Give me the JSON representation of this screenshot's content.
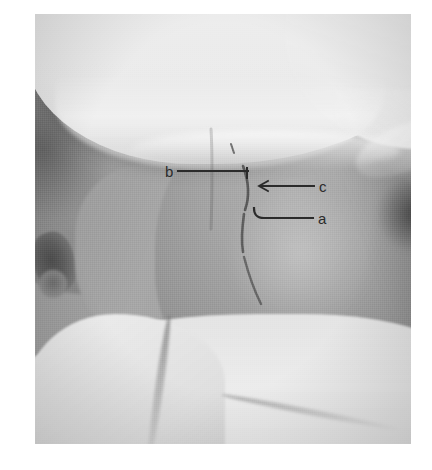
{
  "figure": {
    "kind": "clinical-photograph",
    "modality": "grayscale photograph",
    "surgical_markings": "ink line drawn on skin over the posterior midline / paraspinal region",
    "drapes": "white cloth drape above the shoulder and white bed sheet below",
    "background_color": "#9a9a9a",
    "ink_color": "#2b2b2b",
    "plate": {
      "left": 35,
      "top": 14,
      "width": 376,
      "height": 430
    }
  },
  "annotations": {
    "items": [
      {
        "id": "b",
        "label": "b",
        "label_x": 165,
        "label_y": 164,
        "leader": {
          "x1": 178,
          "y1": 171,
          "x2": 248,
          "y2": 171
        },
        "arrowhead": "tick-down",
        "points_to": "upper end of the skin marking"
      },
      {
        "id": "c",
        "label": "c",
        "label_x": 319,
        "label_y": 179,
        "leader": {
          "x1": 314,
          "y1": 186,
          "x2": 258,
          "y2": 186
        },
        "arrowhead": "arrow-left",
        "points_to": "middle of the skin marking"
      },
      {
        "id": "a",
        "label": "a",
        "label_x": 318,
        "label_y": 211,
        "leader": {
          "x1": 313,
          "y1": 218,
          "x2": 258,
          "y2": 218
        },
        "arrowhead": "hook-left",
        "points_to": "lower portion of the skin marking"
      }
    ]
  }
}
